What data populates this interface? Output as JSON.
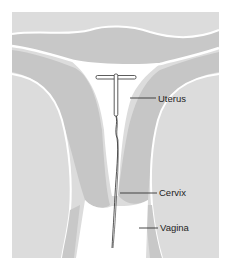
{
  "diagram": {
    "colors": {
      "background": "#ffffff",
      "outer_tissue": "#dcdcdc",
      "uterine_wall": "#c6c6c6",
      "cavity": "#ffffff",
      "iud_outline": "#333333",
      "string": "#2a2a2a",
      "leader_line": "#333333",
      "label_text": "#1e1e1e"
    },
    "labels": [
      {
        "text": "Uterus",
        "x": 158,
        "y": 102
      },
      {
        "text": "Cervix",
        "x": 159,
        "y": 196
      },
      {
        "text": "Vagina",
        "x": 160,
        "y": 231
      }
    ],
    "iud": {
      "shape": "T-shaped device",
      "crossbar": {
        "x1": 96,
        "x2": 136,
        "y": 77
      },
      "stem": {
        "x": 116,
        "y1": 77,
        "y2": 116
      }
    }
  }
}
